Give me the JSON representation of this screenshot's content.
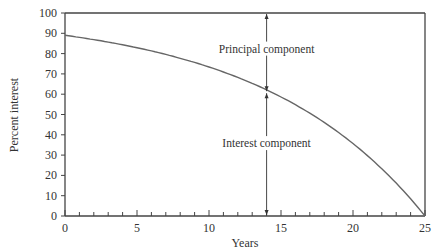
{
  "chart_data": {
    "type": "line",
    "title": "",
    "xlabel": "Years",
    "ylabel": "Percent interest",
    "xlim": [
      0,
      25
    ],
    "ylim": [
      0,
      100
    ],
    "x_ticks": [
      "0",
      "5",
      "10",
      "15",
      "20",
      "25"
    ],
    "y_ticks": [
      "0",
      "10",
      "20",
      "30",
      "40",
      "50",
      "60",
      "70",
      "80",
      "90",
      "100"
    ],
    "grid": false,
    "legend": null,
    "series": [
      {
        "name": "Interest share of payment",
        "x": [
          0,
          2.5,
          5,
          7.5,
          10,
          12.5,
          15,
          17.5,
          20,
          22.5,
          25
        ],
        "values": [
          89,
          87,
          84,
          80,
          74,
          66,
          57,
          46,
          32,
          16,
          0
        ]
      }
    ],
    "reference_line": {
      "y": 100
    },
    "annotations": [
      {
        "text": "Principal component",
        "x": 14,
        "span": [
          61,
          100
        ]
      },
      {
        "text": "Interest component",
        "x": 14,
        "span": [
          0,
          61
        ]
      }
    ]
  }
}
